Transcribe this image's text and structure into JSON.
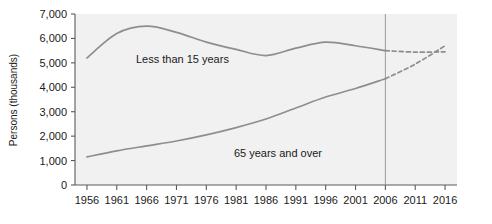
{
  "chart_data": {
    "type": "line",
    "title": "",
    "xlabel": "",
    "ylabel": "Persons (thousands)",
    "xlim": [
      1954,
      2018
    ],
    "ylim": [
      0,
      7000
    ],
    "xticks": [
      1956,
      1961,
      1966,
      1971,
      1976,
      1981,
      1986,
      1991,
      1996,
      2001,
      2006,
      2011,
      2016
    ],
    "xticklabels": [
      "1956",
      "1961",
      "1966",
      "1971",
      "1976",
      "1981",
      "1986",
      "1991",
      "1996",
      "2001",
      "2006",
      "2011",
      "2016"
    ],
    "yticks": [
      0,
      1000,
      2000,
      3000,
      4000,
      5000,
      6000,
      7000
    ],
    "yticklabels": [
      "0",
      "1,000",
      "2,000",
      "3,000",
      "4,000",
      "5,000",
      "6,000",
      "7,000"
    ],
    "grid": false,
    "legend_position": "inline-annotations",
    "projection_divider_x": 2006,
    "series": [
      {
        "name": "Less than 15 years",
        "label_x": 1972,
        "label_y": 5000,
        "observed": {
          "x": [
            1956,
            1961,
            1966,
            1971,
            1976,
            1981,
            1986,
            1991,
            1996,
            2001,
            2006
          ],
          "values": [
            5200,
            6200,
            6500,
            6250,
            5850,
            5550,
            5300,
            5600,
            5850,
            5700,
            5500
          ]
        },
        "projected": {
          "x": [
            2006,
            2011,
            2016
          ],
          "values": [
            5500,
            5440,
            5450
          ]
        }
      },
      {
        "name": "65 years and over",
        "label_x": 1988,
        "label_y": 1150,
        "observed": {
          "x": [
            1956,
            1961,
            1966,
            1971,
            1976,
            1981,
            1986,
            1991,
            1996,
            2001,
            2006
          ],
          "values": [
            1150,
            1400,
            1600,
            1800,
            2050,
            2350,
            2700,
            3150,
            3600,
            3950,
            4350
          ]
        },
        "projected": {
          "x": [
            2006,
            2011,
            2016
          ],
          "values": [
            4350,
            4950,
            5700
          ]
        }
      }
    ]
  }
}
